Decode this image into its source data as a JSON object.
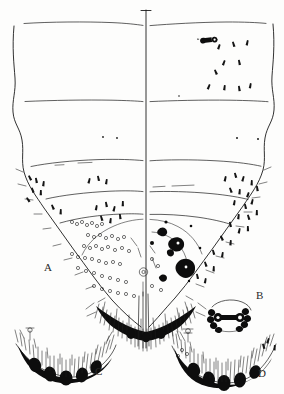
{
  "figure": {
    "type": "taxonomic-line-drawing",
    "style": "ink line drawing, stippled setae, black sclerotized lobes",
    "background_color": "#fdfdfc",
    "ink_color": "#1b1b1b",
    "midline_x": 146,
    "width": 284,
    "height": 394
  },
  "panels": [
    {
      "id": "A",
      "label": "A",
      "name": "whole-body-outline",
      "description": "Large split body outline with three transverse segment lines, lateral setae clusters, pygidial pore groups and a dense marginal setal fringe",
      "label_x": 44,
      "label_y": 262
    },
    {
      "id": "B",
      "label": "B",
      "name": "dumbbell-structure-detail",
      "description": "Enlarged dumbbell shaped sclerite with beaded dark margins and two terminal rings",
      "label_x": 256,
      "label_y": 290
    },
    {
      "id": "C",
      "label": "C",
      "name": "posterior-margin-detail-c",
      "description": "Curved posterior margin bearing four dark rounded lobes and a dense brush of long setae",
      "label_x": 95,
      "label_y": 366
    },
    {
      "id": "D",
      "label": "D",
      "name": "posterior-margin-detail-d",
      "description": "Curved posterior margin with five dark rounded lobes, long marginal setae and a stalked gland at upper left",
      "label_x": 258,
      "label_y": 368
    }
  ],
  "features": {
    "segment_lines": 3,
    "spiracle_marker": "small dumbbell shaped spiracle near upper right of body",
    "pore_clusters": "rings of small circular pores around the vulvar opening",
    "dark_blotches": "irregular black sclerotized patches right of midline in pygidial area",
    "marginal_fringe": "dense dark fringe of setae along posterior body margin"
  }
}
